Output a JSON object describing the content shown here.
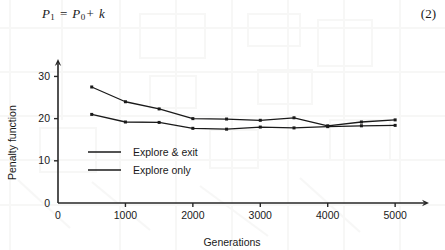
{
  "equation": {
    "lhs": "P",
    "lhs_sub": "1",
    "eq": "=",
    "rhs": "P",
    "rhs_sub": "0",
    "plus": "+",
    "term": "k",
    "number": "(2)"
  },
  "chart_data": {
    "type": "line",
    "title": "",
    "xlabel": "Generations",
    "ylabel": "Penalty function",
    "xlim": [
      0,
      5250
    ],
    "ylim": [
      0,
      32
    ],
    "xticks": [
      0,
      1000,
      2000,
      3000,
      4000,
      5000
    ],
    "xticklabels": [
      "0",
      "1000",
      "2000",
      "3000",
      "4000",
      "5000"
    ],
    "yticks": [
      0,
      10,
      20,
      30
    ],
    "yticklabels": [
      "0",
      "10",
      "20",
      "30"
    ],
    "grid": false,
    "legend_position": "inside-lower-left",
    "x": [
      500,
      1000,
      1500,
      2000,
      2500,
      3000,
      3500,
      4000,
      4500,
      5000
    ],
    "series": [
      {
        "name": "Explore & exit",
        "color": "#1a1a1a",
        "values": [
          27.5,
          24.0,
          22.3,
          20.0,
          19.9,
          19.6,
          20.2,
          18.3,
          19.2,
          19.7
        ]
      },
      {
        "name": "Explore only",
        "color": "#1a1a1a",
        "values": [
          21.0,
          19.2,
          19.1,
          17.7,
          17.5,
          18.0,
          17.8,
          18.1,
          18.3,
          18.4
        ]
      }
    ]
  }
}
